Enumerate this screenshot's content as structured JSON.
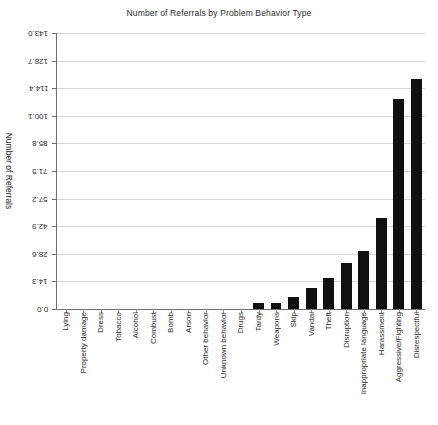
{
  "chart_data": {
    "type": "bar",
    "title": "Number of Referrals by Problem Behavior Type",
    "xlabel": "",
    "ylabel": "Number of Referrals",
    "ylim": [
      0,
      143.0
    ],
    "grid": true,
    "legend": "none",
    "orientation": "vertical",
    "bar_color": "#101010",
    "yticks": [
      "0.0",
      "14.3",
      "28.6",
      "42.9",
      "57.2",
      "71.5",
      "85.8",
      "100.1",
      "114.4",
      "128.7",
      "143.0"
    ],
    "ytick_values": [
      0.0,
      14.3,
      28.6,
      42.9,
      57.2,
      71.5,
      85.8,
      100.1,
      114.4,
      128.7,
      143.0
    ],
    "categories": [
      "Lying",
      "Property damage",
      "Dress",
      "Tobacco",
      "Alcohol",
      "Combust",
      "Bomb",
      "Arson",
      "Other behavior",
      "Unknown behavior",
      "Drugs",
      "Tardy",
      "Weapons",
      "Skip",
      "Vandal",
      "Theft",
      "Disruption",
      "Inappropriate language",
      "Harassment",
      "Aggressive/Fighting",
      "Disrespectful"
    ],
    "values": [
      0,
      0,
      0,
      0,
      0,
      0,
      0,
      0,
      0,
      0,
      0,
      3,
      3,
      6,
      11,
      16,
      24,
      30,
      47,
      109,
      119
    ]
  },
  "figure": {
    "title": "Number of Referrals by Problem Behavior Type",
    "axis_label_y": "Number of Referrals"
  }
}
